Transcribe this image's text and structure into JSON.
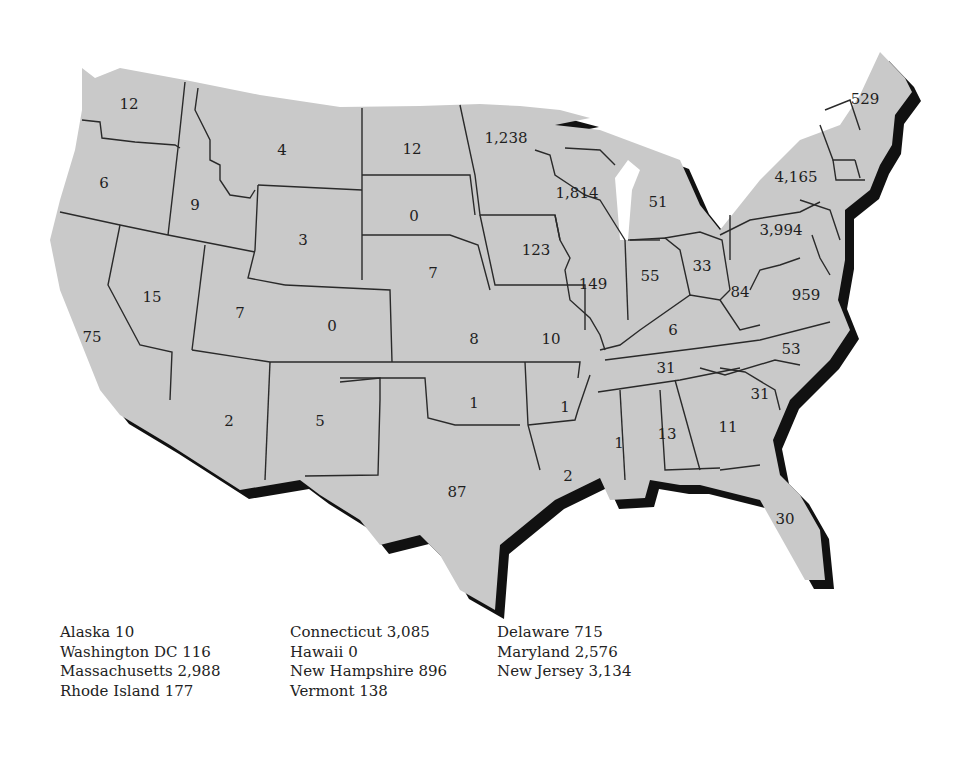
{
  "map": {
    "type": "choropleth-count-map",
    "region": "Contiguous United States",
    "fill_color": "#c9c9c9",
    "border_color": "#2a2a2a",
    "shadow_color": "#111111",
    "states": [
      {
        "id": "WA",
        "value": "12",
        "x": 129,
        "y": 104
      },
      {
        "id": "OR",
        "value": "6",
        "x": 104,
        "y": 183
      },
      {
        "id": "CA",
        "value": "75",
        "x": 92,
        "y": 337
      },
      {
        "id": "ID",
        "value": "9",
        "x": 195,
        "y": 205
      },
      {
        "id": "NV",
        "value": "15",
        "x": 152,
        "y": 297
      },
      {
        "id": "MT",
        "value": "4",
        "x": 282,
        "y": 150
      },
      {
        "id": "WY",
        "value": "3",
        "x": 303,
        "y": 240
      },
      {
        "id": "UT",
        "value": "7",
        "x": 240,
        "y": 313
      },
      {
        "id": "CO",
        "value": "0",
        "x": 332,
        "y": 326
      },
      {
        "id": "AZ",
        "value": "2",
        "x": 229,
        "y": 421
      },
      {
        "id": "NM",
        "value": "5",
        "x": 320,
        "y": 421
      },
      {
        "id": "ND",
        "value": "12",
        "x": 412,
        "y": 149
      },
      {
        "id": "SD",
        "value": "0",
        "x": 414,
        "y": 216
      },
      {
        "id": "NE",
        "value": "7",
        "x": 433,
        "y": 273
      },
      {
        "id": "KS",
        "value": "8",
        "x": 474,
        "y": 339
      },
      {
        "id": "OK",
        "value": "1",
        "x": 474,
        "y": 403
      },
      {
        "id": "TX",
        "value": "87",
        "x": 457,
        "y": 492
      },
      {
        "id": "MN",
        "value": "1,238",
        "x": 506,
        "y": 138
      },
      {
        "id": "IA",
        "value": "123",
        "x": 536,
        "y": 250
      },
      {
        "id": "MO",
        "value": "10",
        "x": 551,
        "y": 339
      },
      {
        "id": "AR",
        "value": "1",
        "x": 565,
        "y": 407
      },
      {
        "id": "LA",
        "value": "2",
        "x": 568,
        "y": 476
      },
      {
        "id": "WI",
        "value": "1,814",
        "x": 577,
        "y": 193
      },
      {
        "id": "IL",
        "value": "149",
        "x": 593,
        "y": 284
      },
      {
        "id": "MI",
        "value": "51",
        "x": 658,
        "y": 202
      },
      {
        "id": "IN",
        "value": "55",
        "x": 650,
        "y": 276
      },
      {
        "id": "OH",
        "value": "33",
        "x": 702,
        "y": 266
      },
      {
        "id": "KY",
        "value": "6",
        "x": 673,
        "y": 330
      },
      {
        "id": "TN",
        "value": "31",
        "x": 666,
        "y": 368
      },
      {
        "id": "MS",
        "value": "1",
        "x": 619,
        "y": 443
      },
      {
        "id": "AL",
        "value": "13",
        "x": 667,
        "y": 434
      },
      {
        "id": "GA",
        "value": "11",
        "x": 728,
        "y": 427
      },
      {
        "id": "FL",
        "value": "30",
        "x": 785,
        "y": 519
      },
      {
        "id": "SC",
        "value": "31",
        "x": 760,
        "y": 394
      },
      {
        "id": "NC",
        "value": "53",
        "x": 791,
        "y": 349
      },
      {
        "id": "VA",
        "value": "959",
        "x": 806,
        "y": 295
      },
      {
        "id": "WV",
        "value": "84",
        "x": 740,
        "y": 292
      },
      {
        "id": "PA",
        "value": "3,994",
        "x": 781,
        "y": 230
      },
      {
        "id": "NY",
        "value": "4,165",
        "x": 796,
        "y": 177
      },
      {
        "id": "ME",
        "value": "529",
        "x": 865,
        "y": 99
      }
    ]
  },
  "legend": {
    "columns": [
      [
        {
          "state": "Alaska",
          "value": "10"
        },
        {
          "state": "Washington DC",
          "value": "116"
        },
        {
          "state": "Massachusetts",
          "value": "2,988"
        },
        {
          "state": "Rhode Island",
          "value": "177"
        }
      ],
      [
        {
          "state": "Connecticut",
          "value": "3,085"
        },
        {
          "state": "Hawaii",
          "value": "0"
        },
        {
          "state": "New Hampshire",
          "value": "896"
        },
        {
          "state": "Vermont",
          "value": "138"
        }
      ],
      [
        {
          "state": "Delaware",
          "value": "715"
        },
        {
          "state": "Maryland",
          "value": "2,576"
        },
        {
          "state": "New Jersey",
          "value": "3,134"
        }
      ]
    ]
  }
}
